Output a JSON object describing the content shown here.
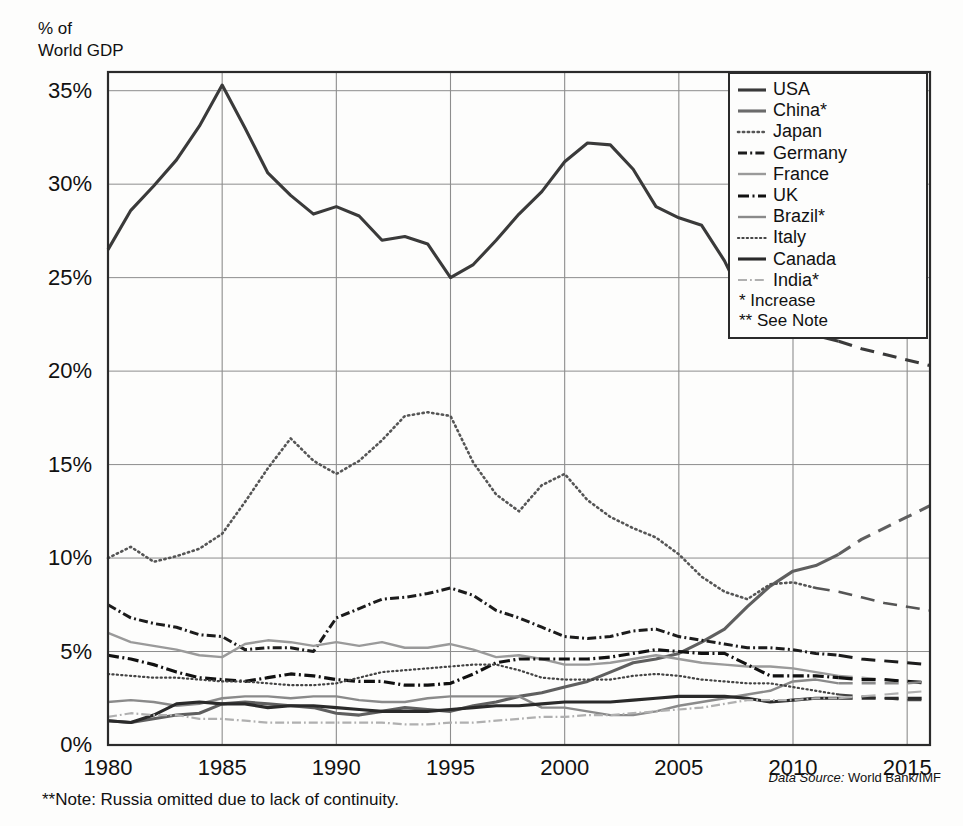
{
  "header": {
    "y_axis_title_line1": "% of",
    "y_axis_title_line2": "World GDP"
  },
  "footer": {
    "note": "**Note: Russia omitted due to lack of continuity.",
    "source_label": "Data Source:",
    "source_value": "World Bank/IMF"
  },
  "legend": {
    "entries": [
      {
        "label": "USA",
        "style": "solid-thick",
        "color": "#3a3a3a"
      },
      {
        "label": "China*",
        "style": "solid-thick",
        "color": "#6b6b6b"
      },
      {
        "label": "Japan",
        "style": "dotted",
        "color": "#555555"
      },
      {
        "label": "Germany",
        "style": "dash-dot",
        "color": "#1c1c1c"
      },
      {
        "label": "France",
        "style": "solid-medium",
        "color": "#9a9a9a"
      },
      {
        "label": "UK",
        "style": "dash-dot-bold",
        "color": "#111111"
      },
      {
        "label": "Brazil*",
        "style": "solid-medium",
        "color": "#8a8a8a"
      },
      {
        "label": "Italy",
        "style": "dotted-fine",
        "color": "#444444"
      },
      {
        "label": "Canada",
        "style": "solid-thick",
        "color": "#2a2a2a"
      },
      {
        "label": "India*",
        "style": "dash-dot-light",
        "color": "#b0b0b0"
      }
    ],
    "notes": [
      "* Increase",
      "** See Note"
    ]
  },
  "chart_data": {
    "type": "line",
    "title": "",
    "xlabel": "",
    "ylabel": "% of World GDP",
    "xlim": [
      1980,
      2016
    ],
    "ylim": [
      0,
      36
    ],
    "grid": true,
    "legend_position": "top-right",
    "y_ticks": [
      "0%",
      "5%",
      "10%",
      "15%",
      "20%",
      "25%",
      "30%",
      "35%"
    ],
    "y_tick_values": [
      0,
      5,
      10,
      15,
      20,
      25,
      30,
      35
    ],
    "x_ticks": [
      "1980",
      "1985",
      "1990",
      "1995",
      "2000",
      "2005",
      "2010",
      "2015"
    ],
    "x_tick_values": [
      1980,
      1985,
      1990,
      1995,
      2000,
      2005,
      2010,
      2015
    ],
    "x": [
      1980,
      1981,
      1982,
      1983,
      1984,
      1985,
      1986,
      1987,
      1988,
      1989,
      1990,
      1991,
      1992,
      1993,
      1994,
      1995,
      1996,
      1997,
      1998,
      1999,
      2000,
      2001,
      2002,
      2003,
      2004,
      2005,
      2006,
      2007,
      2008,
      2009,
      2010,
      2011,
      2012,
      2013,
      2014,
      2015,
      2016
    ],
    "series": [
      {
        "name": "USA",
        "style": "solid-thick",
        "color": "#3a3a3a",
        "dashed_from": 2012,
        "values": [
          26.5,
          28.6,
          29.9,
          31.3,
          33.1,
          35.3,
          33.0,
          30.6,
          29.4,
          28.4,
          28.8,
          28.3,
          27.0,
          27.2,
          26.8,
          25.0,
          25.7,
          27.0,
          28.4,
          29.6,
          31.2,
          32.2,
          32.1,
          30.8,
          28.8,
          28.2,
          27.8,
          25.9,
          23.4,
          24.5,
          23.0,
          21.9,
          21.6,
          21.2,
          20.9,
          20.6,
          20.3
        ]
      },
      {
        "name": "China*",
        "style": "solid-thick",
        "color": "#5f5f5f",
        "dashed_from": 2012,
        "values": [
          1.3,
          1.2,
          1.4,
          1.6,
          1.7,
          2.2,
          2.3,
          2.2,
          2.1,
          2.0,
          1.7,
          1.6,
          1.8,
          2.0,
          1.9,
          1.8,
          2.1,
          2.3,
          2.6,
          2.8,
          3.1,
          3.4,
          3.9,
          4.4,
          4.6,
          4.9,
          5.5,
          6.2,
          7.4,
          8.5,
          9.3,
          9.6,
          10.2,
          11.0,
          11.6,
          12.2,
          12.8
        ]
      },
      {
        "name": "Japan",
        "style": "dotted",
        "color": "#555555",
        "dashed_from": 2011,
        "values": [
          10.0,
          10.6,
          9.8,
          10.1,
          10.5,
          11.3,
          13.0,
          14.8,
          16.4,
          15.2,
          14.5,
          15.2,
          16.3,
          17.6,
          17.8,
          17.6,
          15.1,
          13.4,
          12.5,
          13.9,
          14.5,
          13.1,
          12.2,
          11.6,
          11.1,
          10.2,
          9.0,
          8.2,
          7.8,
          8.6,
          8.7,
          8.4,
          8.2,
          7.9,
          7.6,
          7.4,
          7.2
        ]
      },
      {
        "name": "Germany",
        "style": "dash-dot",
        "color": "#1c1c1c",
        "dashed_from": 2012,
        "values": [
          7.5,
          6.8,
          6.5,
          6.3,
          5.9,
          5.8,
          5.1,
          5.2,
          5.2,
          5.0,
          6.8,
          7.3,
          7.8,
          7.9,
          8.1,
          8.4,
          8.0,
          7.2,
          6.8,
          6.3,
          5.8,
          5.7,
          5.8,
          6.1,
          6.2,
          5.8,
          5.6,
          5.4,
          5.2,
          5.2,
          5.1,
          4.9,
          4.8,
          4.6,
          4.5,
          4.4,
          4.3
        ]
      },
      {
        "name": "France",
        "style": "solid-medium",
        "color": "#9a9a9a",
        "dashed_from": 2012,
        "values": [
          6.0,
          5.5,
          5.3,
          5.1,
          4.8,
          4.7,
          5.4,
          5.6,
          5.5,
          5.3,
          5.5,
          5.3,
          5.5,
          5.2,
          5.2,
          5.4,
          5.1,
          4.7,
          4.8,
          4.6,
          4.3,
          4.3,
          4.4,
          4.6,
          4.8,
          4.6,
          4.4,
          4.3,
          4.2,
          4.2,
          4.1,
          3.9,
          3.7,
          3.6,
          3.5,
          3.4,
          3.4
        ]
      },
      {
        "name": "UK",
        "style": "dash-dot-bold",
        "color": "#111111",
        "dashed_from": 2012,
        "values": [
          4.8,
          4.6,
          4.3,
          3.9,
          3.6,
          3.5,
          3.4,
          3.6,
          3.8,
          3.7,
          3.5,
          3.4,
          3.4,
          3.2,
          3.2,
          3.3,
          3.8,
          4.4,
          4.6,
          4.6,
          4.6,
          4.6,
          4.7,
          4.9,
          5.1,
          5.0,
          4.9,
          4.9,
          4.3,
          3.7,
          3.7,
          3.7,
          3.6,
          3.5,
          3.5,
          3.4,
          3.3
        ]
      },
      {
        "name": "Brazil*",
        "style": "solid-medium",
        "color": "#8a8a8a",
        "dashed_from": 2012,
        "values": [
          2.3,
          2.4,
          2.3,
          2.1,
          2.2,
          2.5,
          2.6,
          2.6,
          2.5,
          2.6,
          2.6,
          2.4,
          2.3,
          2.3,
          2.5,
          2.6,
          2.6,
          2.6,
          2.6,
          2.0,
          2.0,
          1.8,
          1.6,
          1.6,
          1.8,
          2.1,
          2.3,
          2.5,
          2.7,
          2.9,
          3.4,
          3.5,
          3.3,
          3.3,
          3.3,
          3.3,
          3.4
        ]
      },
      {
        "name": "Italy",
        "style": "dotted-fine",
        "color": "#444444",
        "dashed_from": 2012,
        "values": [
          3.8,
          3.7,
          3.6,
          3.6,
          3.5,
          3.4,
          3.4,
          3.3,
          3.2,
          3.2,
          3.3,
          3.6,
          3.9,
          4.0,
          4.1,
          4.2,
          4.3,
          4.3,
          4.0,
          3.6,
          3.5,
          3.5,
          3.5,
          3.7,
          3.8,
          3.7,
          3.5,
          3.4,
          3.3,
          3.3,
          3.1,
          2.9,
          2.7,
          2.6,
          2.5,
          2.4,
          2.4
        ]
      },
      {
        "name": "Canada",
        "style": "solid-thick",
        "color": "#2a2a2a",
        "dashed_from": 2012,
        "values": [
          1.3,
          1.2,
          1.6,
          2.2,
          2.3,
          2.2,
          2.2,
          2.0,
          2.1,
          2.1,
          2.0,
          1.9,
          1.8,
          1.8,
          1.8,
          1.9,
          2.0,
          2.1,
          2.1,
          2.2,
          2.3,
          2.3,
          2.3,
          2.4,
          2.5,
          2.6,
          2.6,
          2.6,
          2.5,
          2.3,
          2.4,
          2.5,
          2.5,
          2.5,
          2.5,
          2.5,
          2.5
        ]
      },
      {
        "name": "India*",
        "style": "dash-dot-light",
        "color": "#b0b0b0",
        "dashed_from": 2012,
        "values": [
          1.5,
          1.7,
          1.6,
          1.6,
          1.4,
          1.4,
          1.3,
          1.2,
          1.2,
          1.2,
          1.2,
          1.2,
          1.2,
          1.1,
          1.1,
          1.2,
          1.2,
          1.3,
          1.4,
          1.5,
          1.5,
          1.6,
          1.6,
          1.7,
          1.8,
          1.9,
          2.0,
          2.2,
          2.4,
          2.4,
          2.4,
          2.5,
          2.5,
          2.6,
          2.7,
          2.8,
          2.9
        ]
      }
    ]
  }
}
